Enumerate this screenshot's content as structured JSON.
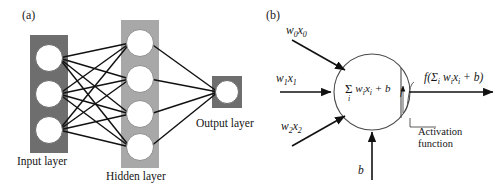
{
  "figure": {
    "panels": [
      {
        "id": "a",
        "label": "(a)",
        "title": "Multilayer neural network architecture"
      },
      {
        "id": "b",
        "label": "(b)",
        "title": "Single artificial neuron model"
      }
    ]
  },
  "panel_a": {
    "label": "(a)",
    "layers": [
      {
        "name": "input",
        "caption": "Input layer",
        "nodes": 3,
        "fill": "#6e6e6e"
      },
      {
        "name": "hidden",
        "caption": "Hidden layer",
        "nodes": 4,
        "fill": "#a8a8a8"
      },
      {
        "name": "output",
        "caption": "Output layer",
        "nodes": 1,
        "fill": "#6e6e6e"
      }
    ],
    "node_fill": "#ffffff",
    "node_stroke": "#555555",
    "edge_color": "#111111",
    "connections": "fully-connected"
  },
  "panel_b": {
    "label": "(b)",
    "inputs": [
      {
        "id": "w0x0",
        "html": "w<sub>0</sub>x<sub>0</sub>"
      },
      {
        "id": "w1x1",
        "html": "w<sub>1</sub>x<sub>1</sub>"
      },
      {
        "id": "w2x2",
        "html": "w<sub>2</sub>x<sub>2</sub>"
      }
    ],
    "bias": {
      "id": "b",
      "html": "b"
    },
    "summation": {
      "sigma": "Σ",
      "index": "i",
      "body_html": "w<sub>i</sub>x<sub>i</sub> + b"
    },
    "activation_symbol": "f",
    "activation_caption_line1": "Activation",
    "activation_caption_line2": "function",
    "output": {
      "id": "output-expression",
      "html": "f(Σ<sub>i</sub> w<sub>i</sub>x<sub>i</sub> + b)"
    },
    "neuron_stroke": "#4a4a4a",
    "arrow_color": "#111111"
  },
  "chart_data": {
    "type": "diagram",
    "panels": [
      {
        "label": "(a)",
        "kind": "network-architecture",
        "layers": [
          {
            "caption": "Input layer",
            "node_count": 3,
            "box_fill": "#6e6e6e"
          },
          {
            "caption": "Hidden layer",
            "node_count": 4,
            "box_fill": "#a8a8a8"
          },
          {
            "caption": "Output layer",
            "node_count": 1,
            "box_fill": "#6e6e6e"
          }
        ],
        "edges": [
          [
            0,
            0
          ],
          [
            0,
            1
          ],
          [
            0,
            2
          ],
          [
            0,
            3
          ],
          [
            1,
            0
          ],
          [
            1,
            1
          ],
          [
            1,
            2
          ],
          [
            1,
            3
          ],
          [
            2,
            0
          ],
          [
            2,
            1
          ],
          [
            2,
            2
          ],
          [
            2,
            3
          ]
        ],
        "hidden_to_output": [
          0,
          1,
          2,
          3
        ]
      },
      {
        "label": "(b)",
        "kind": "neuron-model",
        "input_labels": [
          "w0x0",
          "w1x1",
          "w2x2"
        ],
        "bias_label": "b",
        "body_expression": "sum_i w_i x_i + b",
        "activation_label": "f",
        "activation_caption": "Activation function",
        "output_expression": "f(sum_i w_i x_i + b)"
      }
    ]
  }
}
